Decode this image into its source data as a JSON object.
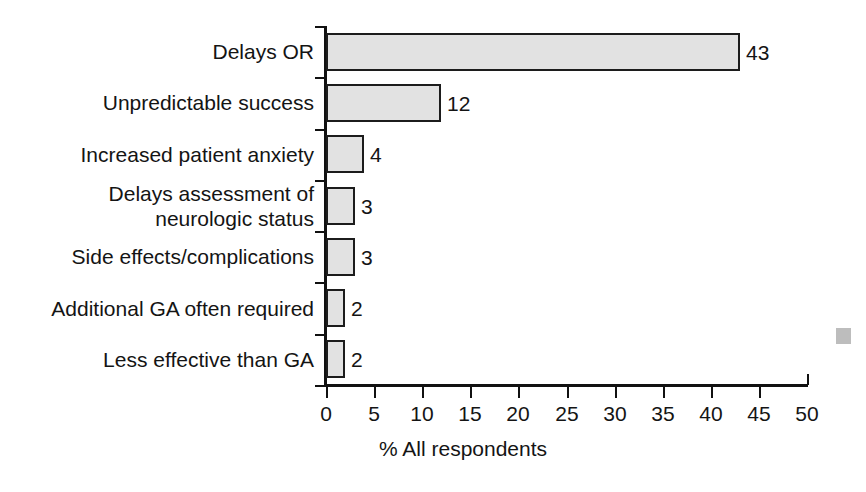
{
  "chart_data": {
    "type": "bar",
    "orientation": "horizontal",
    "title": "",
    "subtitle": "",
    "xlabel": "% All respondents",
    "ylabel": "",
    "xlim": [
      0,
      50
    ],
    "xticks": [
      0,
      5,
      10,
      15,
      20,
      25,
      30,
      35,
      40,
      45,
      50
    ],
    "xtick_labels": [
      "0",
      "5",
      "10",
      "15",
      "20",
      "25",
      "30",
      "35",
      "40",
      "45",
      "50"
    ],
    "grid": false,
    "legend": null,
    "bar_fill_color": "#e2e2e2",
    "bar_edge_color": "#1c1c1c",
    "categories": [
      "Delays OR",
      "Unpredictable success",
      "Increased patient anxiety",
      "Delays assessment of\nneurologic status",
      "Side effects/complications",
      "Additional GA often required",
      "Less effective than GA"
    ],
    "values": [
      43,
      12,
      4,
      3,
      3,
      2,
      2
    ],
    "value_labels": [
      "43",
      "12",
      "4",
      "3",
      "3",
      "2",
      "2"
    ]
  },
  "bars": [
    {
      "label": "Delays OR",
      "label_lines": [
        "Delays OR"
      ],
      "value": 43,
      "value_label": "43"
    },
    {
      "label": "Unpredictable success",
      "label_lines": [
        "Unpredictable success"
      ],
      "value": 12,
      "value_label": "12"
    },
    {
      "label": "Increased patient anxiety",
      "label_lines": [
        "Increased patient anxiety"
      ],
      "value": 4,
      "value_label": "4"
    },
    {
      "label": "Delays assessment of neurologic status",
      "label_lines": [
        "Delays assessment of",
        "neurologic status"
      ],
      "value": 3,
      "value_label": "3"
    },
    {
      "label": "Side effects/complications",
      "label_lines": [
        "Side effects/complications"
      ],
      "value": 3,
      "value_label": "3"
    },
    {
      "label": "Additional GA often required",
      "label_lines": [
        "Additional GA often required"
      ],
      "value": 2,
      "value_label": "2"
    },
    {
      "label": "Less effective than GA",
      "label_lines": [
        "Less effective than GA"
      ],
      "value": 2,
      "value_label": "2"
    }
  ],
  "axis": {
    "x_title": "% All respondents",
    "x_ticks": [
      "0",
      "5",
      "10",
      "15",
      "20",
      "25",
      "30",
      "35",
      "40",
      "45",
      "50"
    ]
  }
}
